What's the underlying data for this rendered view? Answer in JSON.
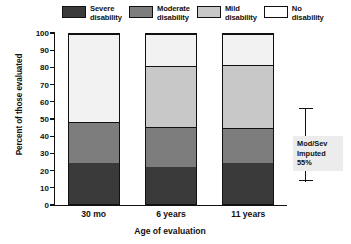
{
  "chart_data": {
    "type": "bar",
    "stacked": true,
    "title": "",
    "xlabel": "Age of evaluation",
    "ylabel": "Percent of those evaluated",
    "categories": [
      "30 mo",
      "6 years",
      "11 years"
    ],
    "ylim": [
      0,
      100
    ],
    "yticks": [
      0,
      10,
      20,
      30,
      40,
      50,
      60,
      70,
      80,
      90,
      100
    ],
    "ytick_labels": [
      "0",
      "10",
      "20",
      "30",
      "40",
      "50",
      "60",
      "70",
      "80",
      "90",
      "100"
    ],
    "grid": false,
    "legend_position": "top",
    "series": [
      {
        "name": "Severe disability",
        "color": "#3a3a3a",
        "values": [
          24,
          21.5,
          24
        ]
      },
      {
        "name": "Moderate disability",
        "color": "#7d7d7d",
        "values": [
          24,
          24,
          21
        ]
      },
      {
        "name": "Mild disability",
        "color": "#c8c8c8",
        "values": [
          0,
          35.5,
          37
        ]
      },
      {
        "name": "No disability",
        "color": "#f2f2f2",
        "values": [
          52,
          19,
          18
        ]
      }
    ],
    "annotations": [
      {
        "text": "Mod/Sev\nImputed\n55%",
        "lines": [
          "Mod/Sev",
          "Imputed",
          "55%"
        ],
        "position": "right-of-last-bar"
      }
    ]
  },
  "legend": {
    "items": [
      {
        "label": "Severe\ndisability",
        "color": "#3a3a3a"
      },
      {
        "label": "Moderate\ndisability",
        "color": "#7d7d7d"
      },
      {
        "label": "Mild\ndisability",
        "color": "#c8c8c8"
      },
      {
        "label": "No\ndisability",
        "color": "#ffffff"
      }
    ]
  },
  "axes": {
    "y_title": "Percent of those evaluated",
    "x_title": "Age of evaluation"
  },
  "annotation": {
    "line1": "Mod/Sev",
    "line2": "Imputed",
    "line3": "55%"
  },
  "colors": {
    "severe": "#3a3a3a",
    "moderate": "#7d7d7d",
    "mild": "#c8c8c8",
    "none": "#f2f2f2",
    "axis": "#111111",
    "annotation_bg": "#ececec"
  }
}
